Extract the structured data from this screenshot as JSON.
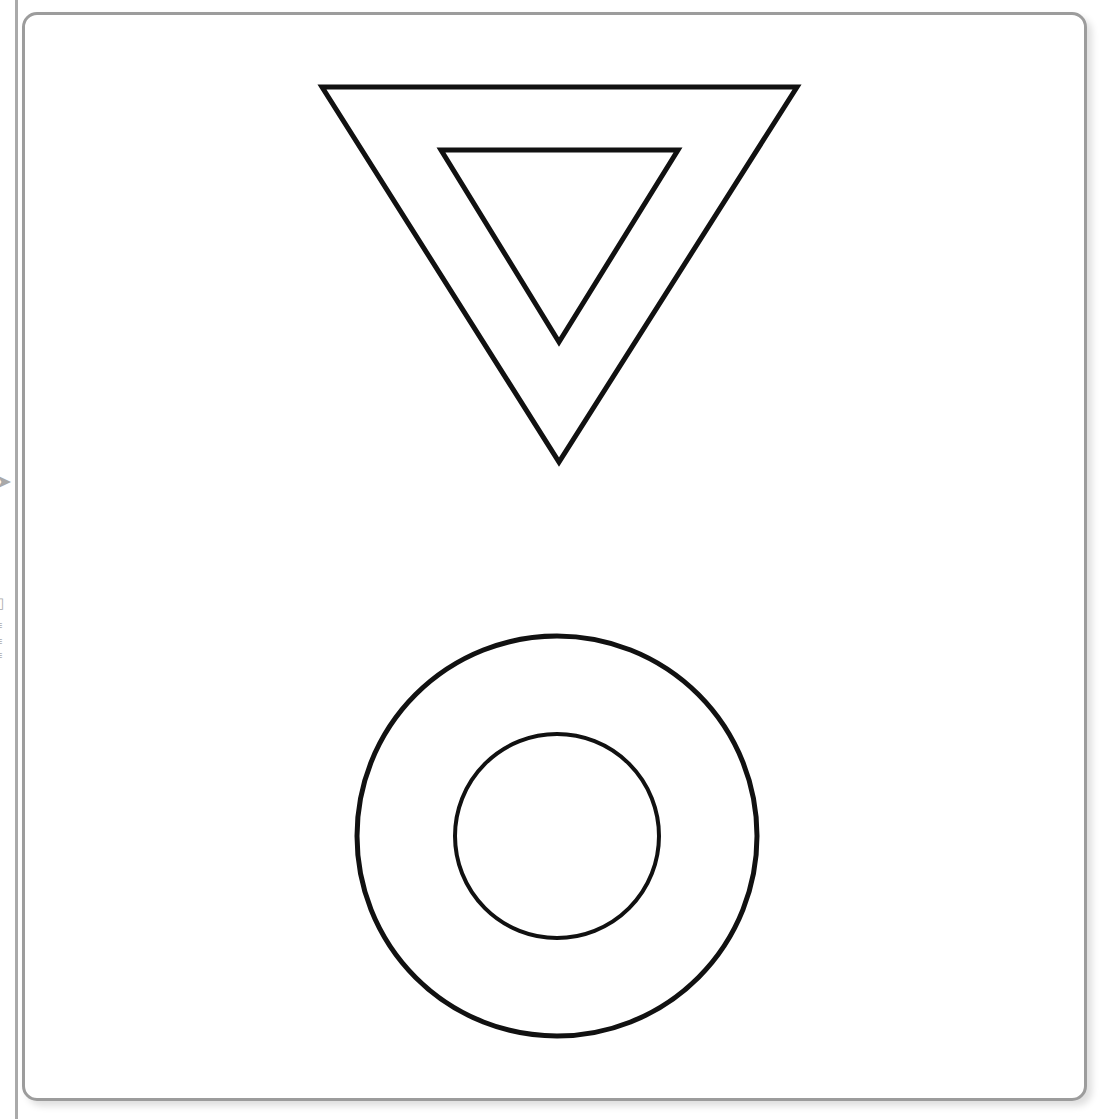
{
  "document": {
    "title": "Shapes Canvas",
    "background_color": "#ffffff"
  },
  "card": {
    "border_color": "#9c9c9c",
    "background_color": "#ffffff",
    "corner_radius_px": 15,
    "border_width_px": 3,
    "left": 22,
    "top": 12,
    "width": 1065,
    "height": 1089
  },
  "edge_panel": {
    "divider_color": "#9b9b9b",
    "glyphs": [
      "➤",
      "▯",
      "≡",
      "≡",
      "≡"
    ]
  },
  "shapes": {
    "stroke_color": "#111111",
    "fill_color": "none",
    "items": [
      {
        "name": "outer-triangle",
        "type": "triangle",
        "orientation": "inverted",
        "points": "322,87 797,87 559,462",
        "stroke_width": 5
      },
      {
        "name": "inner-triangle",
        "type": "triangle",
        "orientation": "inverted",
        "points": "441,150 678,150 559,342",
        "stroke_width": 5
      },
      {
        "name": "outer-circle",
        "type": "circle",
        "cx": 557,
        "cy": 836,
        "r": 200,
        "stroke_width": 5
      },
      {
        "name": "inner-circle",
        "type": "circle",
        "cx": 557,
        "cy": 836,
        "r": 102,
        "stroke_width": 4
      }
    ]
  }
}
